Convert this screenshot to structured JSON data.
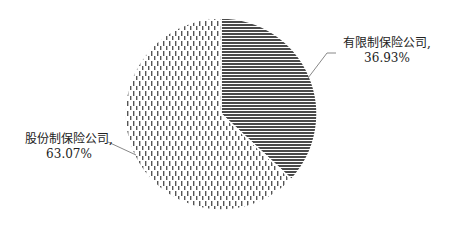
{
  "chart_data": {
    "type": "pie",
    "title": "",
    "slices": [
      {
        "label": "有限制保险公司",
        "value": 36.93,
        "display": "36.93%",
        "pattern": "horizontal-lines",
        "color": "#4a4a4a"
      },
      {
        "label": "股份制保险公司",
        "value": 63.07,
        "display": "63.07%",
        "pattern": "vertical-dashes",
        "color": "#555555"
      }
    ],
    "start_angle": "12 o'clock",
    "direction": "clockwise",
    "legend": "none",
    "data_labels": "outside with leader lines"
  },
  "labels": {
    "right": {
      "name": "有限制保险公司,",
      "pct": "36.93%"
    },
    "left": {
      "name": "股份制保险公司,",
      "pct": "63.07%"
    }
  }
}
